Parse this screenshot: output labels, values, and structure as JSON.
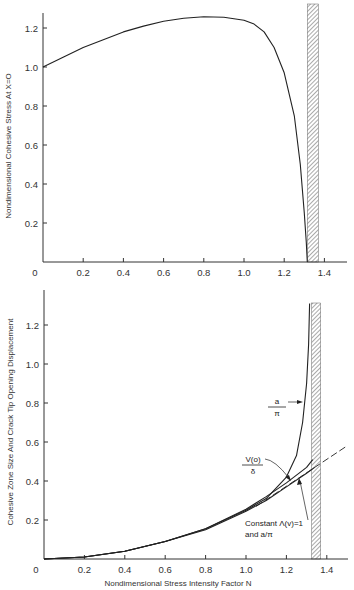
{
  "chart_data": [
    {
      "type": "line",
      "title": "",
      "xlabel": "",
      "ylabel": "Nondimensional Cohesive Stress At X=O",
      "xlim": [
        0,
        1.5
      ],
      "ylim": [
        0,
        1.3
      ],
      "xticks": [
        "0",
        "0.2",
        "0.4",
        "0.6",
        "0.8",
        "1.0",
        "1.2",
        "1.4"
      ],
      "yticks": [
        "0.2",
        "0.4",
        "0.6",
        "0.8",
        "1.0",
        "1.2"
      ],
      "grid": false,
      "legend": null,
      "hatched_limit": {
        "x_start": 1.315,
        "x_end": 1.37
      },
      "series": [
        {
          "name": "Cohesive stress at X=0",
          "style": "solid",
          "x": [
            0,
            0.1,
            0.2,
            0.3,
            0.4,
            0.5,
            0.6,
            0.7,
            0.8,
            0.9,
            1.0,
            1.05,
            1.1,
            1.15,
            1.2,
            1.25,
            1.28,
            1.3,
            1.31,
            1.315
          ],
          "y": [
            1.0,
            1.05,
            1.1,
            1.14,
            1.18,
            1.21,
            1.235,
            1.25,
            1.258,
            1.255,
            1.24,
            1.22,
            1.18,
            1.1,
            0.97,
            0.75,
            0.5,
            0.25,
            0.1,
            0.0
          ]
        }
      ]
    },
    {
      "type": "line",
      "title": "",
      "xlabel": "Nondimensional Stress Intensity Factor N",
      "ylabel": "Cohesive Zone Size And Crack Tip Opening Displacement",
      "xlim": [
        0,
        1.5
      ],
      "ylim": [
        0,
        1.35
      ],
      "xticks": [
        "0",
        "0.2",
        "0.4",
        "0.6",
        "0.8",
        "1.0",
        "1.2",
        "1.4"
      ],
      "yticks": [
        "0.2",
        "0.4",
        "0.6",
        "0.8",
        "1.0",
        "1.2"
      ],
      "grid": false,
      "legend": null,
      "hatched_limit": {
        "x_start": 1.325,
        "x_end": 1.37
      },
      "annotations": [
        {
          "label_top": "a",
          "label_bottom": "π",
          "target_series": "a/π"
        },
        {
          "label_top": "V(o)",
          "label_bottom": "δ",
          "target_series": "V(0)/δ"
        },
        {
          "label_line1": "Constant Λ(v)=1",
          "label_line2": "and a/π",
          "target_series": "Constant Λ(v)=1 and a/π"
        }
      ],
      "series": [
        {
          "name": "a/π",
          "style": "solid",
          "x": [
            0,
            0.2,
            0.4,
            0.6,
            0.8,
            1.0,
            1.1,
            1.2,
            1.25,
            1.28,
            1.3,
            1.31,
            1.315
          ],
          "y": [
            0,
            0.01,
            0.04,
            0.09,
            0.155,
            0.25,
            0.31,
            0.42,
            0.53,
            0.7,
            0.9,
            1.1,
            1.31
          ]
        },
        {
          "name": "V(0)/δ",
          "style": "solid",
          "x": [
            0,
            0.2,
            0.4,
            0.6,
            0.8,
            1.0,
            1.1,
            1.2,
            1.3,
            1.33
          ],
          "y": [
            0,
            0.01,
            0.04,
            0.09,
            0.155,
            0.255,
            0.32,
            0.39,
            0.47,
            0.51
          ]
        },
        {
          "name": "Constant Λ(v)=1 and a/π",
          "style": "solid",
          "x": [
            0,
            0.2,
            0.4,
            0.6,
            0.8,
            1.0,
            1.1,
            1.2,
            1.3,
            1.34
          ],
          "y": [
            0,
            0.01,
            0.04,
            0.09,
            0.15,
            0.245,
            0.3,
            0.37,
            0.44,
            0.47
          ]
        },
        {
          "name": "Constant Λ(v)=1 extrapolation",
          "style": "dashed",
          "x": [
            1.05,
            1.34,
            1.5
          ],
          "y": [
            0.27,
            0.47,
            0.58
          ]
        }
      ]
    }
  ]
}
